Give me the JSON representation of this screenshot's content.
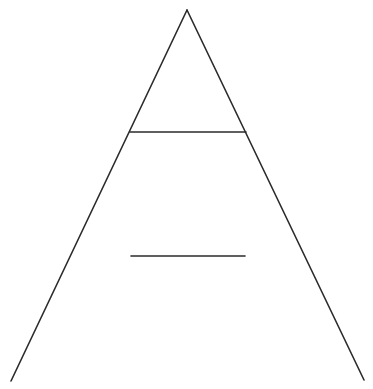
{
  "diagram": {
    "type": "pyramid",
    "stroke_color": "#2b2b2b",
    "background": "#ffffff",
    "stroke_width": 1.6,
    "apex": {
      "x": 187,
      "y": 10
    },
    "base_left": {
      "x": 11,
      "y": 381
    },
    "base_right": {
      "x": 364,
      "y": 380
    },
    "divider_top": {
      "x1": 130,
      "y1": 132,
      "x2": 246,
      "y2": 132
    },
    "divider_middle": {
      "x1": 131,
      "y1": 256,
      "x2": 245,
      "y2": 256
    },
    "labels": []
  }
}
